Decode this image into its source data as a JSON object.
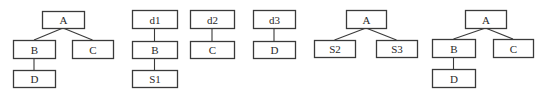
{
  "diagram": {
    "type": "tree-decomposition",
    "stroke_color": "#3a3a3a",
    "text_color": "#2a2a2a",
    "background": "#ffffff",
    "trees": [
      {
        "id": "tree-1",
        "nodes": [
          {
            "id": "t1-A",
            "label": "A",
            "x": 42,
            "y": 11,
            "w": 42,
            "h": 17
          },
          {
            "id": "t1-B",
            "label": "B",
            "x": 13,
            "y": 40,
            "w": 42,
            "h": 18
          },
          {
            "id": "t1-C",
            "label": "C",
            "x": 72,
            "y": 40,
            "w": 41,
            "h": 18
          },
          {
            "id": "t1-D",
            "label": "D",
            "x": 13,
            "y": 70,
            "w": 42,
            "h": 17
          }
        ],
        "edges": [
          {
            "from": "t1-A",
            "to": "t1-B",
            "style": "diag"
          },
          {
            "from": "t1-A",
            "to": "t1-C",
            "style": "diag"
          },
          {
            "from": "t1-B",
            "to": "t1-D",
            "style": "vert"
          }
        ]
      },
      {
        "id": "tree-2",
        "nodes": [
          {
            "id": "t2-d1",
            "label": "d1",
            "x": 132,
            "y": 10,
            "w": 45,
            "h": 18
          },
          {
            "id": "t2-B",
            "label": "B",
            "x": 132,
            "y": 41,
            "w": 45,
            "h": 17
          },
          {
            "id": "t2-S1",
            "label": "S1",
            "x": 132,
            "y": 70,
            "w": 45,
            "h": 17
          }
        ],
        "edges": [
          {
            "from": "t2-d1",
            "to": "t2-B",
            "style": "vert"
          },
          {
            "from": "t2-B",
            "to": "t2-S1",
            "style": "vert"
          }
        ]
      },
      {
        "id": "tree-3",
        "nodes": [
          {
            "id": "t3-d2",
            "label": "d2",
            "x": 190,
            "y": 10,
            "w": 44,
            "h": 18
          },
          {
            "id": "t3-C",
            "label": "C",
            "x": 190,
            "y": 41,
            "w": 44,
            "h": 17
          }
        ],
        "edges": [
          {
            "from": "t3-d2",
            "to": "t3-C",
            "style": "vert"
          }
        ]
      },
      {
        "id": "tree-4",
        "nodes": [
          {
            "id": "t4-d3",
            "label": "d3",
            "x": 253,
            "y": 10,
            "w": 42,
            "h": 18
          },
          {
            "id": "t4-D",
            "label": "D",
            "x": 253,
            "y": 41,
            "w": 42,
            "h": 17
          }
        ],
        "edges": [
          {
            "from": "t4-d3",
            "to": "t4-D",
            "style": "vert"
          }
        ]
      },
      {
        "id": "tree-5",
        "nodes": [
          {
            "id": "t5-A",
            "label": "A",
            "x": 346,
            "y": 10,
            "w": 40,
            "h": 18
          },
          {
            "id": "t5-S2",
            "label": "S2",
            "x": 314,
            "y": 40,
            "w": 41,
            "h": 17
          },
          {
            "id": "t5-S3",
            "label": "S3",
            "x": 376,
            "y": 40,
            "w": 41,
            "h": 17
          }
        ],
        "edges": [
          {
            "from": "t5-A",
            "to": "t5-S2",
            "style": "diag"
          },
          {
            "from": "t5-A",
            "to": "t5-S3",
            "style": "diag"
          }
        ]
      },
      {
        "id": "tree-6",
        "nodes": [
          {
            "id": "t6-A",
            "label": "A",
            "x": 465,
            "y": 10,
            "w": 41,
            "h": 18
          },
          {
            "id": "t6-B",
            "label": "B",
            "x": 432,
            "y": 39,
            "w": 43,
            "h": 18
          },
          {
            "id": "t6-C",
            "label": "C",
            "x": 493,
            "y": 39,
            "w": 40,
            "h": 18
          },
          {
            "id": "t6-D",
            "label": "D",
            "x": 432,
            "y": 69,
            "w": 43,
            "h": 18
          }
        ],
        "edges": [
          {
            "from": "t6-A",
            "to": "t6-B",
            "style": "diag"
          },
          {
            "from": "t6-A",
            "to": "t6-C",
            "style": "diag"
          },
          {
            "from": "t6-B",
            "to": "t6-D",
            "style": "vert"
          }
        ]
      }
    ]
  }
}
